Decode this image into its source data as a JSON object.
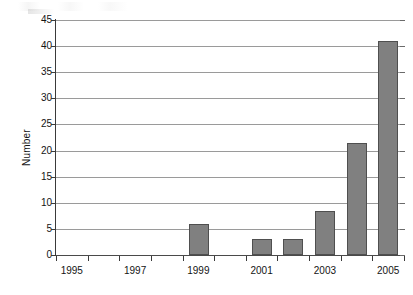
{
  "chart_data": {
    "type": "bar",
    "title": "",
    "subtitle": "",
    "xlabel": "",
    "ylabel": "Number",
    "categories": [
      "1995",
      "1996",
      "1997",
      "1998",
      "1999",
      "2000",
      "2001",
      "2002",
      "2003",
      "2004",
      "2005"
    ],
    "values": [
      0,
      0,
      0,
      0,
      6,
      0,
      3,
      3,
      8.5,
      21.5,
      41
    ],
    "x_tick_labels": [
      "1995",
      "1997",
      "1999",
      "2001",
      "2003",
      "2005"
    ],
    "x_tick_label_categories": [
      "1995",
      "1997",
      "1999",
      "2001",
      "2003",
      "2005"
    ],
    "y_tick_labels": [
      "0",
      "5",
      "10",
      "15",
      "20",
      "25",
      "30",
      "35",
      "40",
      "45"
    ],
    "y_ticks": [
      0,
      5,
      10,
      15,
      20,
      25,
      30,
      35,
      40,
      45
    ],
    "ylim": [
      0,
      45
    ],
    "grid": true,
    "grid_axis": "y",
    "legend": false,
    "legend_position": "none",
    "bar_color": "#808080",
    "bar_border_color": "#4f4f4f",
    "gridline_color": "#9a9a9a",
    "axis_color": "#3a3a3a",
    "background_color": "#ffffff",
    "series": [
      {
        "name": "Number",
        "values": [
          0,
          0,
          0,
          0,
          6,
          0,
          3,
          3,
          8.5,
          21.5,
          41
        ]
      }
    ]
  },
  "axes": {
    "y_title": "Number"
  }
}
